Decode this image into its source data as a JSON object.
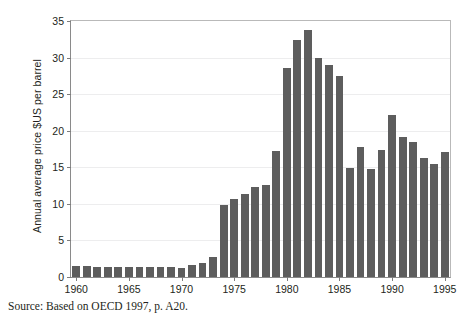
{
  "figure": {
    "clipped_title": "",
    "source_note": "Source: Based on OECD 1997, p. A20."
  },
  "chart_data": {
    "type": "bar",
    "title": "",
    "xlabel": "",
    "ylabel": "Annual average price $US per barrel",
    "ylim": [
      0,
      35
    ],
    "ytick_labels": [
      "0",
      "5",
      "10",
      "15",
      "20",
      "25",
      "30",
      "35"
    ],
    "yticks": [
      0,
      5,
      10,
      15,
      20,
      25,
      30,
      35
    ],
    "xtick_labels": [
      "1960",
      "1965",
      "1970",
      "1975",
      "1980",
      "1985",
      "1990",
      "1995"
    ],
    "xticks": [
      1960,
      1965,
      1970,
      1975,
      1980,
      1985,
      1990,
      1995
    ],
    "xlim": [
      1959.5,
      1995.5
    ],
    "grid": "horizontal",
    "legend": "none",
    "bar_color": "#5d5d5d",
    "categories": [
      "1960",
      "1961",
      "1962",
      "1963",
      "1964",
      "1965",
      "1966",
      "1967",
      "1968",
      "1969",
      "1970",
      "1971",
      "1972",
      "1973",
      "1974",
      "1975",
      "1976",
      "1977",
      "1978",
      "1979",
      "1980",
      "1981",
      "1982",
      "1983",
      "1984",
      "1985",
      "1986",
      "1987",
      "1988",
      "1989",
      "1990",
      "1991",
      "1992",
      "1993",
      "1994",
      "1995"
    ],
    "values": [
      1.5,
      1.45,
      1.42,
      1.4,
      1.4,
      1.4,
      1.38,
      1.38,
      1.35,
      1.32,
      1.3,
      1.7,
      1.9,
      2.7,
      9.8,
      10.6,
      11.4,
      12.3,
      12.6,
      17.2,
      28.6,
      32.4,
      33.8,
      30.0,
      29.0,
      27.5,
      14.9,
      17.8,
      14.7,
      17.4,
      22.2,
      19.2,
      18.4,
      16.3,
      15.5,
      17.1
    ],
    "series": [
      {
        "name": "Annual average crude oil price",
        "values": [
          1.5,
          1.45,
          1.42,
          1.4,
          1.4,
          1.4,
          1.38,
          1.38,
          1.35,
          1.32,
          1.3,
          1.7,
          1.9,
          2.7,
          9.8,
          10.6,
          11.4,
          12.3,
          12.6,
          17.2,
          28.6,
          32.4,
          33.8,
          30.0,
          29.0,
          27.5,
          14.9,
          17.8,
          14.7,
          17.4,
          22.2,
          19.2,
          18.4,
          16.3,
          15.5,
          17.1
        ]
      }
    ]
  }
}
